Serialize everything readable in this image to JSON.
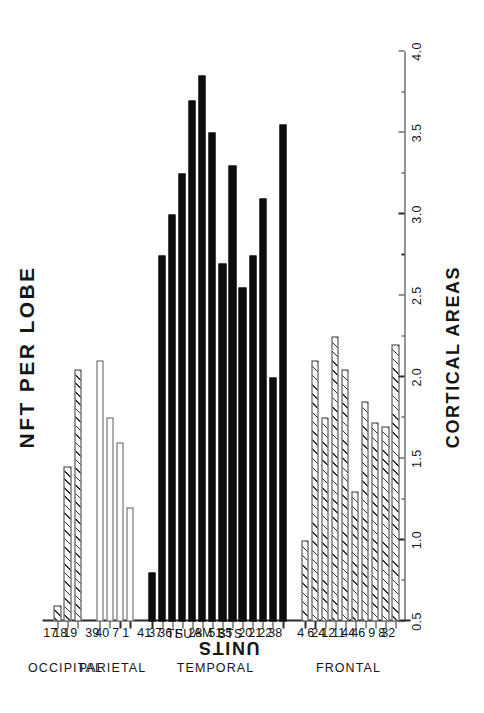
{
  "figure": {
    "title": "NFT PER LOBE",
    "value_axis_title": "UNITS",
    "category_axis_title": "CORTICAL AREAS"
  },
  "chart_data": {
    "type": "bar",
    "orientation": "horizontal",
    "title": "NFT PER LOBE",
    "xlabel": "UNITS",
    "ylabel": "CORTICAL AREAS",
    "xlim": [
      0.5,
      4.0
    ],
    "grid": false,
    "legend": null,
    "tick_labels": [
      "0.5",
      "1.0",
      "1.5",
      "2.0",
      "2.5",
      "3.0",
      "3.5",
      "4.0"
    ],
    "tick_values": [
      0.5,
      1.0,
      1.5,
      2.0,
      2.5,
      3.0,
      3.5,
      4.0
    ],
    "minor_tick_values": [
      0.75,
      1.25,
      1.75,
      2.25,
      2.75,
      3.25,
      3.75
    ],
    "groups": [
      {
        "name": "FRONTAL",
        "fill": "hatched",
        "categories": [
          "32",
          "8",
          "9",
          "46",
          "44",
          "11",
          "12",
          "24",
          "6",
          "4"
        ],
        "values": [
          2.2,
          1.7,
          1.72,
          1.85,
          1.3,
          2.05,
          2.25,
          1.75,
          2.1,
          1.0
        ]
      },
      {
        "name": "TEMPORAL",
        "fill": "solid-black",
        "categories": [
          "38",
          "22",
          "21",
          "20",
          "STS",
          "35",
          "51",
          "AM",
          "28",
          "SU",
          "TF",
          "36",
          "37",
          "41"
        ],
        "values": [
          3.55,
          2.0,
          3.1,
          2.75,
          2.55,
          3.3,
          2.7,
          3.5,
          3.85,
          3.7,
          3.25,
          3.0,
          2.75,
          0.8
        ]
      },
      {
        "name": "PARIETAL",
        "fill": "open-white",
        "categories": [
          "1",
          "7",
          "40",
          "39"
        ],
        "values": [
          1.2,
          1.6,
          1.75,
          2.1
        ]
      },
      {
        "name": "OCCIPITAL",
        "fill": "hatched",
        "categories": [
          "19",
          "18",
          "17"
        ],
        "values": [
          2.05,
          1.45,
          0.6
        ]
      }
    ]
  }
}
